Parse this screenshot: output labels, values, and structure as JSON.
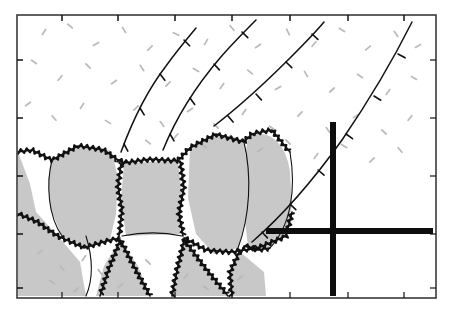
{
  "figure": {
    "type": "line-drawing",
    "width": 456,
    "height": 317,
    "background_color": "#ffffff"
  },
  "colors": {
    "grain_fill": "#c8c8c8",
    "matrix_fill": "#ffffff",
    "ink": "#111111",
    "frame": "#3a3a3a",
    "stipple": "#b9b9b9",
    "grid": "#0d0d0d"
  },
  "frame": {
    "name": "outer-frame",
    "x": 17,
    "y": 15,
    "width": 419,
    "height": 283,
    "stroke_width": 1.6,
    "tick_length": 6,
    "top_ticks_x": [
      62,
      118,
      175,
      232,
      290,
      348,
      404
    ],
    "left_ticks_y": [
      60,
      118,
      176,
      234,
      288
    ],
    "bottom_ticks_x": [
      62,
      118,
      175,
      232,
      290,
      348,
      404
    ],
    "right_ticks_y": [
      60,
      118,
      176,
      234,
      288
    ]
  },
  "grid_lines": {
    "name": "reference-grid",
    "stroke_width": 6,
    "vertical": {
      "x": 333,
      "y1": 122,
      "y2": 296
    },
    "horizontal": {
      "y": 231,
      "x1": 266,
      "x2": 433
    }
  },
  "grains": [
    {
      "id": "grain-left-margin",
      "label": "left marginal grain",
      "fill": "grain_fill",
      "path": "M18,152 L18,296 L86,296 L80,262 L58,236 L36,212 L30,184 Z"
    },
    {
      "id": "grain-left-lens",
      "label": "left lenticular grain",
      "fill": "grain_fill",
      "path": "M52,160 C68,146 96,142 112,152 L118,178 L116,214 L110,240 L88,248 L62,236 L50,208 L48,180 Z"
    },
    {
      "id": "grain-core",
      "label": "core equant grain",
      "fill": "grain_fill",
      "path": "M124,163 L178,161 L182,196 L180,234 L126,236 L121,200 Z"
    },
    {
      "id": "grain-right-lens",
      "label": "right lenticular grain",
      "fill": "grain_fill",
      "path": "M190,148 C208,134 232,132 244,142 L248,178 L246,218 L238,248 L214,254 L196,234 L188,198 Z"
    },
    {
      "id": "grain-far-right-lens",
      "label": "far right lenticular grain",
      "fill": "grain_fill",
      "path": "M248,136 C268,128 286,142 290,172 L292,206 L286,234 L268,250 L248,246 L243,206 L244,166 Z"
    },
    {
      "id": "grain-lower-left-wedge",
      "label": "lower left wedge grain",
      "fill": "grain_fill",
      "path": "M18,214 L44,238 L72,262 L86,296 L18,296 Z"
    },
    {
      "id": "grain-lower-mid-left",
      "label": "lower mid-left grain",
      "fill": "grain_fill",
      "path": "M120,240 L138,266 L150,296 L96,296 L104,266 Z"
    },
    {
      "id": "grain-lower-mid-right",
      "label": "lower mid-right grain",
      "fill": "grain_fill",
      "path": "M184,240 L206,266 L228,296 L174,296 L178,266 Z"
    },
    {
      "id": "grain-lower-right",
      "label": "lower right grain",
      "fill": "grain_fill",
      "path": "M240,252 L264,272 L266,296 L232,296 L230,272 Z"
    }
  ],
  "sutured_boundaries": [
    {
      "id": "suture-upper-left",
      "label": "upper left sutured contact",
      "path": "M18,152 L32,150 L52,160 L78,146 L104,150 L118,160"
    },
    {
      "id": "suture-core-top",
      "label": "core grain top suture",
      "path": "M118,160 L124,163 L150,159 L178,161 L190,148"
    },
    {
      "id": "suture-right-top",
      "label": "right lens top suture",
      "path": "M190,148 L216,134 L244,142 L252,134 L272,130 L290,152"
    },
    {
      "id": "suture-core-left",
      "label": "core grain left suture",
      "path": "M121,163 L118,186 L122,210 L119,236"
    },
    {
      "id": "suture-core-right",
      "label": "core grain right suture",
      "path": "M180,161 L184,188 L179,214 L183,236"
    },
    {
      "id": "suture-left-lens-base",
      "label": "left lens basal suture",
      "path": "M18,214 L38,222 L58,236 L84,248 L110,240 L120,238"
    },
    {
      "id": "suture-right-lens-base",
      "label": "right lens basal suture",
      "path": "M184,238 L206,250 L232,252 L258,248 L286,236 L292,212"
    },
    {
      "id": "suture-lower-left-branch",
      "label": "lower left branch suture",
      "path": "M120,240 L110,266 L100,296"
    },
    {
      "id": "suture-lower-left-branch2",
      "label": "lower left branch suture 2",
      "path": "M120,240 L134,266 L150,296"
    },
    {
      "id": "suture-lower-mid-branch",
      "label": "lower mid branch suture",
      "path": "M184,240 L178,266 L172,296"
    },
    {
      "id": "suture-lower-mid-branch2",
      "label": "lower mid branch suture 2",
      "path": "M184,240 L204,266 L228,296"
    },
    {
      "id": "suture-lower-right-branch",
      "label": "lower right branch suture",
      "path": "M240,250 L230,272 L232,296"
    },
    {
      "id": "suture-far-right-base",
      "label": "far right lens base suture",
      "path": "M244,246 L258,250 L270,248"
    }
  ],
  "smooth_boundaries": [
    {
      "id": "outline-left-lens",
      "label": "left lens smooth outline",
      "path": "M52,160 C46,184 48,216 62,236"
    },
    {
      "id": "outline-right-lens",
      "label": "right lens smooth outline",
      "path": "M244,142 C252,176 250,216 238,248"
    },
    {
      "id": "outline-far-right-lens",
      "label": "far right lens smooth outline",
      "path": "M290,152 C296,188 292,226 268,250"
    },
    {
      "id": "outline-lower-left-curve",
      "label": "lower left curved contact",
      "path": "M86,236 C94,262 92,282 86,296"
    },
    {
      "id": "outline-core-base",
      "label": "core grain base contact",
      "path": "M122,236 C142,232 164,232 182,236"
    }
  ],
  "foliation_traces": [
    {
      "id": "foliation-trace-1",
      "label": "leftmost foliation trace with barbs",
      "path": "M121,152 C132,122 146,92 166,66 C176,52 186,40 196,28",
      "barbs": [
        {
          "x": 124,
          "y": 144,
          "angle": -28
        },
        {
          "x": 140,
          "y": 108,
          "angle": -32
        },
        {
          "x": 160,
          "y": 74,
          "angle": -38
        },
        {
          "x": 184,
          "y": 40,
          "angle": -44
        }
      ]
    },
    {
      "id": "foliation-trace-2",
      "label": "second foliation trace with barbs",
      "path": "M163,150 C176,118 196,86 220,58 C232,44 244,32 256,20",
      "barbs": [
        {
          "x": 170,
          "y": 134,
          "angle": -30
        },
        {
          "x": 190,
          "y": 98,
          "angle": -36
        },
        {
          "x": 214,
          "y": 64,
          "angle": -42
        },
        {
          "x": 242,
          "y": 32,
          "angle": -46
        }
      ]
    },
    {
      "id": "foliation-trace-3",
      "label": "third foliation trace with barbs",
      "path": "M214,126 C240,106 266,82 290,58 C302,46 314,34 324,22",
      "barbs": [
        {
          "x": 228,
          "y": 116,
          "angle": -40
        },
        {
          "x": 256,
          "y": 94,
          "angle": -42
        },
        {
          "x": 286,
          "y": 62,
          "angle": -46
        },
        {
          "x": 312,
          "y": 34,
          "angle": -48
        }
      ]
    },
    {
      "id": "foliation-trace-4",
      "label": "major arcuate trace with barbs",
      "path": "M252,242 C282,216 312,182 342,140 C368,102 392,62 412,22",
      "barbs": [
        {
          "x": 262,
          "y": 232,
          "angle": -42
        },
        {
          "x": 290,
          "y": 204,
          "angle": -46
        },
        {
          "x": 318,
          "y": 170,
          "angle": -50
        },
        {
          "x": 346,
          "y": 134,
          "angle": -54
        },
        {
          "x": 374,
          "y": 96,
          "angle": -58
        },
        {
          "x": 398,
          "y": 54,
          "angle": -62
        }
      ]
    }
  ],
  "stipple": {
    "name": "matrix-stipple-texture",
    "description": "scattered short light-gray dashes representing fine-grained matrix",
    "dash_length": 6,
    "marks": [
      [
        44,
        32,
        -55
      ],
      [
        70,
        26,
        40
      ],
      [
        96,
        44,
        -30
      ],
      [
        124,
        30,
        60
      ],
      [
        150,
        48,
        -45
      ],
      [
        176,
        34,
        25
      ],
      [
        206,
        42,
        -60
      ],
      [
        232,
        28,
        50
      ],
      [
        258,
        46,
        -35
      ],
      [
        288,
        32,
        65
      ],
      [
        314,
        44,
        -50
      ],
      [
        342,
        30,
        30
      ],
      [
        368,
        48,
        -40
      ],
      [
        396,
        34,
        55
      ],
      [
        418,
        46,
        -28
      ],
      [
        34,
        62,
        35
      ],
      [
        60,
        78,
        -50
      ],
      [
        88,
        66,
        45
      ],
      [
        114,
        82,
        -35
      ],
      [
        142,
        68,
        55
      ],
      [
        168,
        84,
        -45
      ],
      [
        196,
        70,
        30
      ],
      [
        222,
        86,
        -55
      ],
      [
        250,
        72,
        40
      ],
      [
        278,
        88,
        -30
      ],
      [
        306,
        74,
        60
      ],
      [
        332,
        90,
        -42
      ],
      [
        360,
        76,
        35
      ],
      [
        388,
        92,
        -52
      ],
      [
        414,
        78,
        28
      ],
      [
        28,
        104,
        -38
      ],
      [
        54,
        118,
        48
      ],
      [
        82,
        106,
        -58
      ],
      [
        108,
        122,
        32
      ],
      [
        136,
        108,
        -44
      ],
      [
        162,
        124,
        52
      ],
      [
        190,
        110,
        -34
      ],
      [
        216,
        126,
        44
      ],
      [
        244,
        112,
        -56
      ],
      [
        272,
        128,
        36
      ],
      [
        300,
        114,
        -46
      ],
      [
        328,
        130,
        54
      ],
      [
        356,
        116,
        -32
      ],
      [
        384,
        132,
        42
      ],
      [
        410,
        118,
        -50
      ],
      [
        148,
        142,
        40
      ],
      [
        176,
        136,
        -48
      ],
      [
        204,
        146,
        34
      ],
      [
        232,
        138,
        56
      ],
      [
        260,
        150,
        -38
      ],
      [
        288,
        142,
        46
      ],
      [
        316,
        156,
        -52
      ],
      [
        344,
        146,
        30
      ],
      [
        372,
        160,
        -44
      ],
      [
        400,
        150,
        50
      ],
      [
        40,
        252,
        -40
      ],
      [
        62,
        268,
        48
      ],
      [
        84,
        258,
        -56
      ],
      [
        52,
        282,
        34
      ],
      [
        76,
        290,
        -46
      ],
      [
        100,
        272,
        52
      ],
      [
        120,
        286,
        -36
      ],
      [
        148,
        262,
        44
      ],
      [
        186,
        276,
        -50
      ],
      [
        206,
        288,
        38
      ],
      [
        240,
        278,
        -42
      ]
    ]
  },
  "legend": {
    "barb_symbol": "tick-barb",
    "suture_symbol": "sutured-contact",
    "grid_symbol": "reference-grid-cross"
  }
}
